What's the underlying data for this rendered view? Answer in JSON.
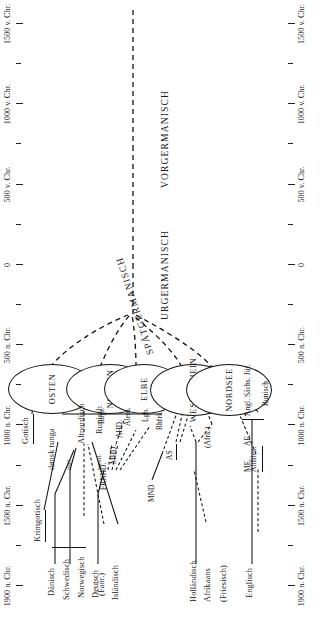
{
  "figure": {
    "orientation": "rotated-90-ccw",
    "axis": {
      "label_suffix_ad": "n. Chr.",
      "label_suffix_bc": "v. Chr.",
      "zero_label": "0",
      "ticks": [
        {
          "label": "1900 n. Chr.",
          "major": true
        },
        {
          "label": "",
          "major": false
        },
        {
          "label": "1500 n. Chr.",
          "major": true
        },
        {
          "label": "",
          "major": false
        },
        {
          "label": "1000 n. Chr.",
          "major": true
        },
        {
          "label": "",
          "major": false
        },
        {
          "label": "500 n. Chr.",
          "major": true
        },
        {
          "label": "",
          "major": false
        },
        {
          "label": "0",
          "major": true
        },
        {
          "label": "",
          "major": false
        },
        {
          "label": "500 v. Chr.",
          "major": true
        },
        {
          "label": "",
          "major": false
        },
        {
          "label": "1000 v. Chr.",
          "major": true
        },
        {
          "label": "",
          "major": false
        },
        {
          "label": "1500 v. Chr.",
          "major": true
        }
      ]
    },
    "stages": [
      {
        "name": "SPÄTGERMANISCH"
      },
      {
        "name": "URGERMANISCH"
      },
      {
        "name": "VORGERMANISCH"
      }
    ],
    "groups": [
      {
        "name": "OSTEN"
      },
      {
        "name": "NORDEN"
      },
      {
        "name": "ELBE"
      },
      {
        "name": "WESER-RHEIN"
      },
      {
        "name": "NORDSEE"
      }
    ],
    "labels": {
      "gotisch": "Gotisch",
      "krimgotisch": "Krimgotisch",
      "runisch_nord": "Runisch",
      "runisch_angl": "Runisch",
      "donsk_tunga": "dønsk tunga",
      "altnordisch": "Altnordisch",
      "oestl": "östl.",
      "westl": "westl.",
      "daenisch": "Dänisch",
      "schwedisch": "Schwedisch",
      "norwegisch": "Norwegisch",
      "faeroer": "(Faör.)",
      "islaendisch": "Isländisch",
      "deutsch": "Deutsch",
      "frnhd": "FRNHD.",
      "mhd": "MHD.",
      "ahd": "AHD.",
      "bayr": "Bayr.",
      "alem": "Alem.",
      "lgb": "Lgb.",
      "rhfrk": "Rhfrk.",
      "mnd": "MND",
      "as": "AS",
      "hollaendisch": "Holländisch",
      "afrikaans": "Afrikaans",
      "friesisch": "(Friesisch)",
      "afrk": "(Afrk.)",
      "altfries": "Altfries.",
      "englisch": "Englisch",
      "me": "ME.",
      "ae": "AE.",
      "angl_saechs_juet": "Angl. Sächs. Jüt."
    }
  }
}
